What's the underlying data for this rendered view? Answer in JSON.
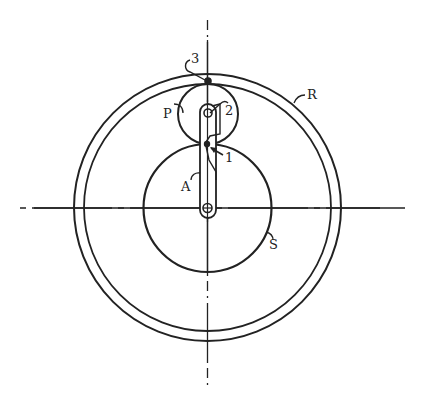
{
  "diagram": {
    "type": "planetary-gear-train",
    "colors": {
      "stroke": "#222222",
      "background": "#ffffff"
    },
    "labels": {
      "ring": "R",
      "planet": "P",
      "sun": "S",
      "arm": "A",
      "point1": "1",
      "point2": "2",
      "point3": "3"
    },
    "components": [
      {
        "id": "R",
        "name": "ring gear"
      },
      {
        "id": "P",
        "name": "planet gear"
      },
      {
        "id": "S",
        "name": "sun gear"
      },
      {
        "id": "A",
        "name": "arm (carrier)"
      }
    ],
    "points": [
      {
        "id": "1",
        "desc": "contact of planet and sun"
      },
      {
        "id": "2",
        "desc": "planet pivot on arm"
      },
      {
        "id": "3",
        "desc": "contact of planet and ring"
      }
    ]
  }
}
